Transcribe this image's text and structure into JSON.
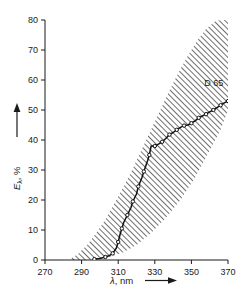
{
  "chart_data": {
    "type": "line",
    "title": "",
    "xlabel": "λ, nm",
    "ylabel": "Eλ, %",
    "xlim": [
      270,
      370
    ],
    "ylim": [
      0,
      80
    ],
    "xticks": [
      270,
      290,
      310,
      330,
      350,
      370
    ],
    "yticks": [
      0,
      10,
      20,
      30,
      40,
      50,
      60,
      70,
      80
    ],
    "xtick_labels": [
      "270",
      "290",
      "310",
      "330",
      "350",
      "370"
    ],
    "ytick_labels": [
      "0",
      "10",
      "20",
      "30",
      "40",
      "50",
      "60",
      "70",
      "80"
    ],
    "grid": false,
    "legend_position": "none",
    "x_axis_arrow": true,
    "y_axis_arrow": true,
    "series": [
      {
        "name": "D 65",
        "label": "D 65",
        "color": "#111111",
        "marker": "circle-open",
        "x": [
          297,
          300,
          303,
          305,
          307,
          309,
          310,
          311,
          312,
          313,
          315,
          317,
          318,
          320,
          321,
          323,
          324,
          326,
          327,
          328,
          330,
          332,
          334,
          336,
          338,
          340,
          342,
          344,
          346,
          348,
          350,
          352,
          354,
          356,
          358,
          360,
          362,
          364,
          366,
          368,
          370
        ],
        "y": [
          0.3,
          0.5,
          1.0,
          1.4,
          2.2,
          4.0,
          6.0,
          8.5,
          10.5,
          12.5,
          15.0,
          17.5,
          19.5,
          22.0,
          24.5,
          27.5,
          29.5,
          33.0,
          35.0,
          38.0,
          38.0,
          38.6,
          39.4,
          40.5,
          41.8,
          42.5,
          43.4,
          44.2,
          44.8,
          45.0,
          45.6,
          46.4,
          47.4,
          48.0,
          48.6,
          49.4,
          50.0,
          50.8,
          51.6,
          52.4,
          53.0
        ]
      }
    ],
    "band": {
      "name": "spectral tolerance band",
      "description": "hatched region between upper and lower solar UV spectral limits",
      "hatch": "diagonal-45",
      "hatch_color": "#4d4d4d",
      "upper_x": [
        283,
        288,
        293,
        298,
        303,
        308,
        313,
        318,
        323,
        328,
        333,
        338,
        343,
        348,
        353,
        358,
        363,
        366
      ],
      "upper_y": [
        0.0,
        2.0,
        5.0,
        9.0,
        13.5,
        19.0,
        24.5,
        30.5,
        37.0,
        43.5,
        50.0,
        56.5,
        62.5,
        68.0,
        73.0,
        77.0,
        79.6,
        80.0
      ],
      "lower_x": [
        283,
        293,
        303,
        313,
        320,
        328,
        336,
        344,
        352,
        360,
        366,
        370
      ],
      "lower_y": [
        0.0,
        0.0,
        0.6,
        2.6,
        5.0,
        9.0,
        14.0,
        20.0,
        27.5,
        36.5,
        43.5,
        50.0
      ]
    },
    "annotations": [
      {
        "text": "D 65",
        "x": 357,
        "y": 58
      }
    ]
  },
  "axes": {
    "x_title": "λ, nm",
    "y_title": "Eλ, %",
    "y_title_symbol": "E",
    "y_title_sub": "λ",
    "y_title_unit": ", %"
  }
}
